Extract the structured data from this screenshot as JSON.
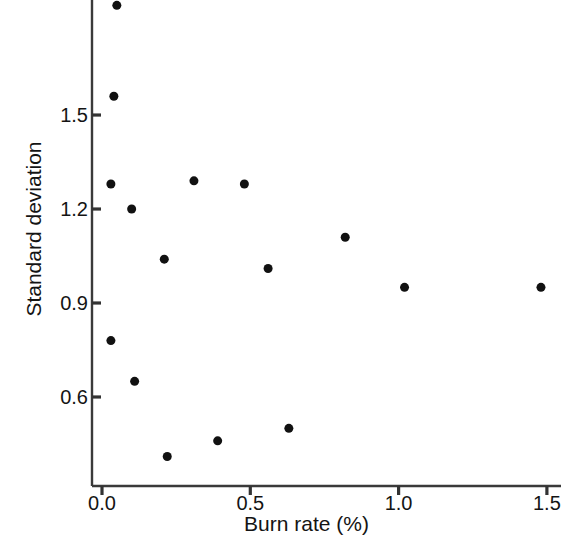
{
  "chart_data": {
    "type": "scatter",
    "title": "",
    "xlabel": "Burn rate (%)",
    "ylabel": "Standard deviation",
    "xlim": [
      -0.06,
      1.58
    ],
    "ylim": [
      0.38,
      1.93
    ],
    "xticks": [
      "0.0",
      "0.5",
      "1.0",
      "1.5"
    ],
    "xtick_values": [
      0.0,
      0.5,
      1.0,
      1.5
    ],
    "yticks": [
      "0.6",
      "0.9",
      "1.2",
      "1.5"
    ],
    "ytick_values": [
      0.6,
      0.9,
      1.2,
      1.5
    ],
    "grid": false,
    "legend": null,
    "marker": "filled-circle",
    "marker_color": "#111111",
    "marker_size_px": 9,
    "axis_color": "#333333",
    "series": [
      {
        "name": "observations",
        "points": [
          {
            "x": 0.05,
            "y": 1.85
          },
          {
            "x": 0.04,
            "y": 1.56
          },
          {
            "x": 0.03,
            "y": 1.28
          },
          {
            "x": 0.1,
            "y": 1.2
          },
          {
            "x": 0.31,
            "y": 1.29
          },
          {
            "x": 0.48,
            "y": 1.28
          },
          {
            "x": 0.82,
            "y": 1.11
          },
          {
            "x": 0.21,
            "y": 1.04
          },
          {
            "x": 0.56,
            "y": 1.01
          },
          {
            "x": 1.02,
            "y": 0.95
          },
          {
            "x": 1.48,
            "y": 0.95
          },
          {
            "x": 0.03,
            "y": 0.78
          },
          {
            "x": 0.11,
            "y": 0.65
          },
          {
            "x": 0.63,
            "y": 0.5
          },
          {
            "x": 0.39,
            "y": 0.46
          },
          {
            "x": 0.22,
            "y": 0.41
          }
        ]
      }
    ]
  }
}
